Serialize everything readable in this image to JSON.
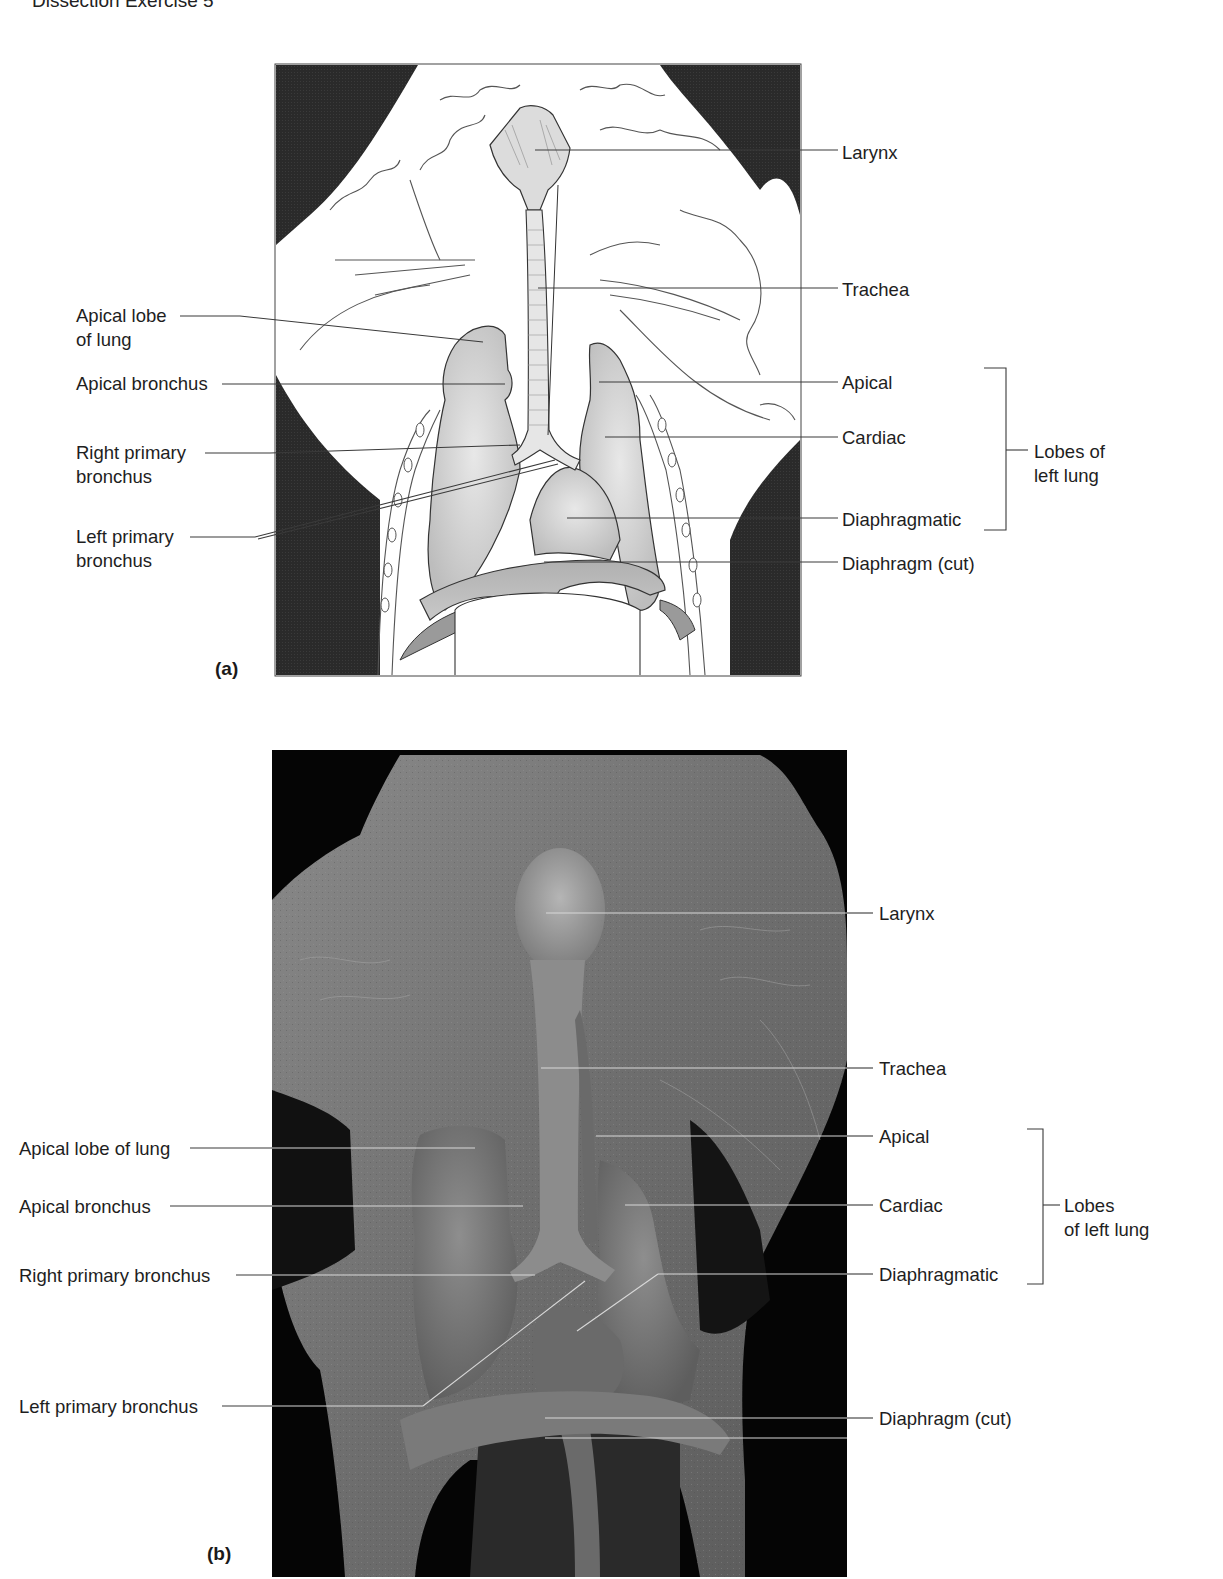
{
  "header": {
    "title": "Dissection Exercise 5"
  },
  "panel_a": {
    "letter": "(a)",
    "kind": "illustration",
    "labels": {
      "larynx": "Larynx",
      "trachea": "Trachea",
      "apical_lobe_line1": "Apical lobe",
      "apical_lobe_line2": "of lung",
      "apical_bronchus": "Apical bronchus",
      "right_primary_line1": "Right primary",
      "right_primary_line2": "bronchus",
      "left_primary_line1": "Left primary",
      "left_primary_line2": "bronchus",
      "apical": "Apical",
      "cardiac": "Cardiac",
      "diaphragmatic": "Diaphragmatic",
      "diaphragm_cut": "Diaphragm (cut)",
      "lobes_group_line1": "Lobes of",
      "lobes_group_line2": "left lung"
    }
  },
  "panel_b": {
    "letter": "(b)",
    "kind": "photograph",
    "labels": {
      "larynx": "Larynx",
      "trachea": "Trachea",
      "apical_lobe": "Apical lobe of lung",
      "apical_bronchus": "Apical bronchus",
      "right_primary": "Right primary bronchus",
      "left_primary": "Left primary bronchus",
      "apical": "Apical",
      "cardiac": "Cardiac",
      "diaphragmatic": "Diaphragmatic",
      "diaphragm_cut": "Diaphragm (cut)",
      "lobes_group_line1": "Lobes",
      "lobes_group_line2": "of left lung"
    }
  },
  "colors": {
    "background": "#ffffff",
    "panel_dark": "#262626",
    "organ_fill": "#d4d4d4",
    "organ_shade": "#b8b8b8",
    "line": "#3a3a3a",
    "photo_bg": "#050505",
    "photo_tissue": "#7e7e7e"
  }
}
